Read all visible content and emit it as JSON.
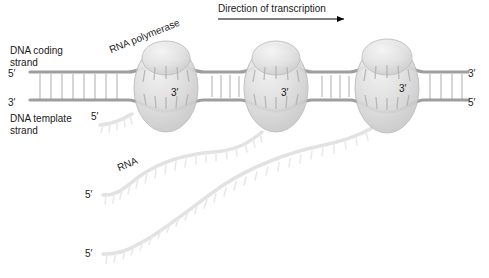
{
  "figure": {
    "width": 489,
    "height": 278,
    "background": "#ffffff"
  },
  "labels": {
    "dna_coding_strand": "DNA coding\nstrand",
    "dna_template_strand": "DNA template\nstrand",
    "rna_polymerase": "RNA polymerase",
    "rna": "RNA",
    "direction_of_transcription": "Direction of transcription"
  },
  "prime_markers": {
    "dna_left_top": "5′",
    "dna_left_bottom": "3′",
    "dna_right_top": "3′",
    "dna_right_bottom": "5′",
    "template_left": "5′",
    "bubble_1": "3′",
    "bubble_2": "3′",
    "bubble_3": "3′",
    "rna_1_start": "5′",
    "rna_2_start": "5′"
  },
  "colors": {
    "background": "#ffffff",
    "text": "#1a1a1a",
    "dna_backbone": "#9a9a9a",
    "dna_rung": "#bdbdbd",
    "polymerase_fill": "#d8d8d8",
    "polymerase_edge": "#b4b4b4",
    "rna_strand": "#e4e4e4",
    "arrow": "#000000"
  },
  "diagram": {
    "type": "biology-schematic",
    "polymerase_count": 3,
    "rna_transcript_count": 3,
    "transcription_direction": "left-to-right",
    "polymerase_positions_x": [
      166,
      278,
      388
    ],
    "dna_axis_y": {
      "coding": 72,
      "template": 100
    }
  }
}
